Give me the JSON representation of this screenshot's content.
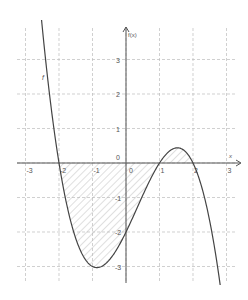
{
  "chart_data": {
    "type": "line",
    "title": "",
    "xlabel": "x",
    "ylabel": "f(x)",
    "function_label": "f",
    "expression": "f(x) = -0.5(x+2)(x-1)(x-2)",
    "xlim": [
      -3.3,
      3.4
    ],
    "ylim": [
      -3.5,
      4
    ],
    "x_ticks": [
      -3,
      -2,
      -1,
      0,
      1,
      2,
      3
    ],
    "x_tick_labels": [
      "-3",
      "-2",
      "-1",
      "0",
      "1",
      "2",
      "3"
    ],
    "y_ticks": [
      -3,
      -2,
      -1,
      0,
      1,
      2,
      3
    ],
    "y_tick_labels": [
      "-3",
      "-2",
      "-1",
      "0",
      "1",
      "2",
      "3"
    ],
    "origin_label": "0",
    "grid": true,
    "grid_style": "dashed",
    "roots": [
      -2,
      1,
      2
    ],
    "key_points": [
      {
        "x": -1,
        "y": -3,
        "note": "local minimum"
      },
      {
        "x": 0,
        "y": -2,
        "note": "y-intercept"
      },
      {
        "x": 1.55,
        "y": 0.44,
        "note": "local maximum"
      }
    ],
    "shaded_region": {
      "from": -2,
      "to": 2,
      "between": "curve and x-axis",
      "pattern": "diagonal hatch"
    },
    "series": [
      {
        "name": "f",
        "x": [
          -2.5,
          -2.25,
          -2,
          -1.75,
          -1.5,
          -1.25,
          -1,
          -0.75,
          -0.5,
          -0.25,
          0,
          0.25,
          0.5,
          0.75,
          1,
          1.25,
          1.5,
          1.75,
          2,
          2.25,
          2.5,
          2.75
        ],
        "values": [
          3.94,
          1.86,
          0,
          -1.46,
          -2.47,
          -2.99,
          -3,
          -2.68,
          -2.06,
          -1.21,
          -2,
          -1.03,
          -0.47,
          -0.09,
          0,
          0.08,
          0.44,
          0.28,
          0,
          -0.53,
          -1.69,
          -3.34
        ]
      }
    ],
    "colors": {
      "curve": "#444444",
      "axis": "#555555",
      "grid": "#bbbbbb",
      "hatch": "#aaaaaa"
    }
  }
}
